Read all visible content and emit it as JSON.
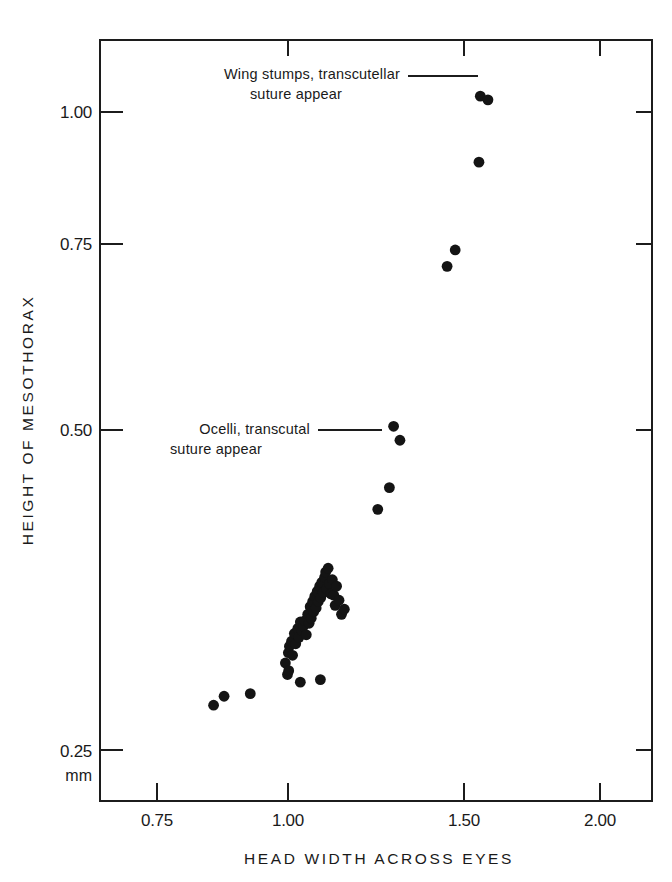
{
  "chart_data": {
    "type": "scatter",
    "title": "",
    "xlabel": "HEAD WIDTH ACROSS EYES",
    "ylabel": "HEIGHT OF MESOTHORAX",
    "y_unit": "mm",
    "xlim": [
      0.68,
      2.12
    ],
    "ylim": [
      0.235,
      1.065
    ],
    "grid": false,
    "legend": false,
    "xticks": [
      0.75,
      1.0,
      1.5,
      2.0
    ],
    "xticklabels": [
      "0.75",
      "1.00",
      "1.50",
      "2.00"
    ],
    "yticks": [
      0.25,
      0.5,
      0.75,
      1.0
    ],
    "yticklabels": [
      "0.25",
      "0.50",
      "0.75",
      "1.00"
    ],
    "x": [
      0.858,
      0.878,
      0.928,
      0.995,
      0.999,
      1.001,
      1.002,
      1.004,
      1.01,
      1.013,
      1.018,
      1.022,
      1.028,
      1.031,
      1.035,
      1.04,
      1.044,
      1.048,
      1.052,
      1.056,
      1.06,
      1.063,
      1.066,
      1.07,
      1.073,
      1.076,
      1.08,
      1.083,
      1.086,
      1.09,
      1.093,
      1.096,
      1.1,
      1.104,
      1.107,
      1.11,
      1.114,
      1.118,
      1.122,
      1.126,
      1.13,
      1.134,
      1.138,
      1.145,
      1.152,
      1.16,
      1.035,
      1.092,
      1.255,
      1.288,
      1.3,
      1.318,
      1.452,
      1.475,
      1.555,
      1.56,
      1.588
    ],
    "y": [
      0.285,
      0.292,
      0.294,
      0.318,
      0.309,
      0.326,
      0.312,
      0.331,
      0.335,
      0.324,
      0.341,
      0.333,
      0.345,
      0.338,
      0.35,
      0.343,
      0.347,
      0.351,
      0.34,
      0.356,
      0.349,
      0.362,
      0.353,
      0.366,
      0.358,
      0.37,
      0.361,
      0.374,
      0.366,
      0.378,
      0.369,
      0.381,
      0.373,
      0.385,
      0.389,
      0.376,
      0.392,
      0.38,
      0.372,
      0.383,
      0.371,
      0.363,
      0.378,
      0.367,
      0.356,
      0.36,
      0.303,
      0.305,
      0.438,
      0.455,
      0.505,
      0.492,
      0.72,
      0.742,
      0.905,
      1.03,
      1.023
    ],
    "annotations": [
      {
        "name": "wing-stumps",
        "lines": [
          "Wing stumps, transcutellar",
          "suture appear"
        ],
        "target_x": 1.555,
        "target_y": 1.03
      },
      {
        "name": "ocelli",
        "lines": [
          "Ocelli, transcutal",
          "suture appear"
        ],
        "target_x": 1.255,
        "target_y": 0.438
      }
    ],
    "point_count": 57,
    "marker": "filled-circle",
    "marker_color": "#141414"
  }
}
